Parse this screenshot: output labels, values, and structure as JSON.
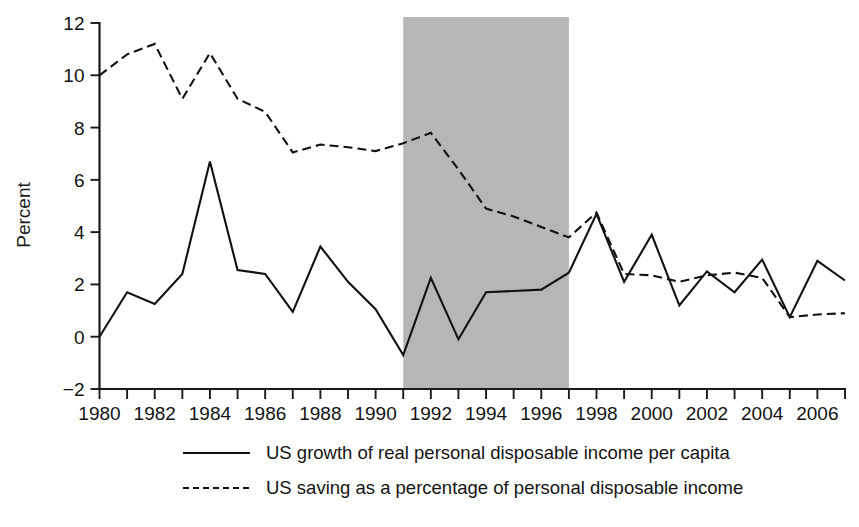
{
  "chart_data": {
    "type": "line",
    "title": "",
    "xlabel": "",
    "ylabel": "Percent",
    "xlim": [
      1980,
      2007
    ],
    "ylim": [
      -2,
      12
    ],
    "y_ticks": [
      -2,
      0,
      2,
      4,
      6,
      8,
      10,
      12
    ],
    "y_tick_labels": [
      "−2",
      "0",
      "2",
      "4",
      "6",
      "8",
      "10",
      "12"
    ],
    "x_ticks": [
      1980,
      1981,
      1982,
      1983,
      1984,
      1985,
      1986,
      1987,
      1988,
      1989,
      1990,
      1991,
      1992,
      1993,
      1994,
      1995,
      1996,
      1997,
      1998,
      1999,
      2000,
      2001,
      2002,
      2003,
      2004,
      2005,
      2006,
      2007
    ],
    "x_tick_labels_shown": [
      "1980",
      "1982",
      "1984",
      "1986",
      "1988",
      "1990",
      "1992",
      "1994",
      "1996",
      "1998",
      "2000",
      "2002",
      "2004",
      "2006"
    ],
    "x": [
      1980,
      1981,
      1982,
      1983,
      1984,
      1985,
      1986,
      1987,
      1988,
      1989,
      1990,
      1991,
      1992,
      1993,
      1994,
      1995,
      1996,
      1997,
      1998,
      1999,
      2000,
      2001,
      2002,
      2003,
      2004,
      2005,
      2006,
      2007
    ],
    "grid": false,
    "legend_position": "below-axes",
    "series": [
      {
        "name": "US growth of real personal disposable income per capita",
        "style": "solid",
        "color": "#111111",
        "values": [
          0.0,
          1.7,
          1.25,
          2.4,
          6.7,
          2.55,
          2.4,
          0.95,
          3.45,
          2.1,
          1.05,
          -0.7,
          2.25,
          -0.1,
          1.7,
          1.75,
          1.8,
          2.45,
          4.7,
          2.1,
          3.9,
          1.2,
          2.5,
          1.7,
          2.95,
          0.75,
          2.9,
          2.15
        ]
      },
      {
        "name": "US saving as a percentage of personal disposable income",
        "style": "dashed",
        "color": "#111111",
        "values": [
          10.0,
          10.8,
          11.2,
          9.1,
          10.85,
          9.1,
          8.6,
          7.05,
          7.35,
          7.25,
          7.1,
          7.4,
          7.8,
          6.4,
          4.9,
          4.6,
          4.2,
          3.8,
          4.75,
          2.4,
          2.35,
          2.1,
          2.35,
          2.45,
          2.25,
          0.75,
          0.85,
          0.9
        ]
      }
    ],
    "shaded_regions": [
      {
        "name": "highlight-band",
        "x_start": 1991,
        "x_end": 1997,
        "color": "#b6b6b6"
      }
    ]
  },
  "legend": {
    "entries": [
      {
        "marker": "solid-line-swatch",
        "label": "US growth of real personal disposable income per capita"
      },
      {
        "marker": "dashed-line-swatch",
        "label": "US saving as a percentage of personal disposable income"
      }
    ]
  }
}
